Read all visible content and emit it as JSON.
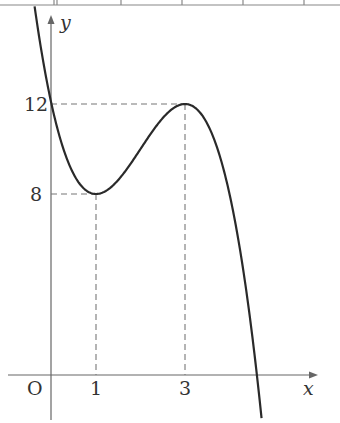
{
  "chart_data": {
    "type": "line",
    "title": "",
    "function": "f(x) = -x^3 + 6x^2 - 9x + 12",
    "xlabel": "x",
    "ylabel": "y",
    "origin_label": "O",
    "x_ticks": [
      {
        "value": 1,
        "label": "1"
      },
      {
        "value": 3,
        "label": "3"
      }
    ],
    "y_ticks": [
      {
        "value": 8,
        "label": "8"
      },
      {
        "value": 12,
        "label": "12"
      }
    ],
    "key_points": [
      {
        "x": 0,
        "y": 12,
        "note": "y-intercept"
      },
      {
        "x": 1,
        "y": 8,
        "note": "local minimum"
      },
      {
        "x": 3,
        "y": 12,
        "note": "local maximum"
      }
    ],
    "guides": [
      {
        "from": [
          0,
          12
        ],
        "to": [
          3,
          12
        ],
        "style": "dashed"
      },
      {
        "from": [
          3,
          12
        ],
        "to": [
          3,
          0
        ],
        "style": "dashed"
      },
      {
        "from": [
          0,
          8
        ],
        "to": [
          1,
          8
        ],
        "style": "dashed"
      },
      {
        "from": [
          1,
          8
        ],
        "to": [
          1,
          0
        ],
        "style": "dashed"
      }
    ],
    "xlim": [
      -1,
      6
    ],
    "ylim": [
      -2,
      16
    ],
    "grid": false,
    "legend": null
  },
  "colors": {
    "curve": "#2a2a2a",
    "axes": "#666666",
    "guides": "#777777",
    "labels": "#333333",
    "table_border": "#888888"
  }
}
